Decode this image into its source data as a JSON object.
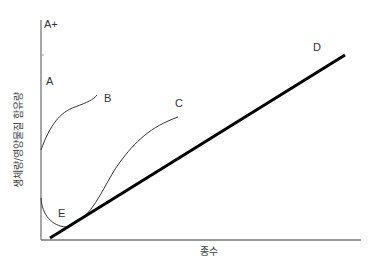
{
  "diagram": {
    "axes": {
      "y_label": "생체량/영양물질 함유량",
      "x_label": "종수"
    },
    "curve_labels": {
      "a_plus": "A+",
      "a": "A",
      "b": "B",
      "c": "C",
      "d": "D",
      "e": "E"
    },
    "colors": {
      "axis": "#777777",
      "curve": "#333333",
      "line_d": "#000000",
      "text": "#333333"
    }
  }
}
